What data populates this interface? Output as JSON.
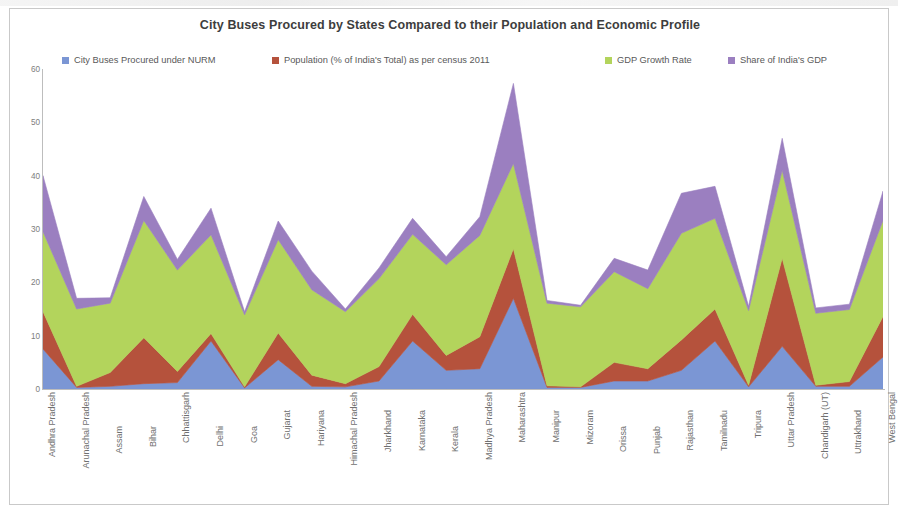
{
  "chart_data": {
    "type": "area",
    "stacked": true,
    "title": "City Buses Procured by States Compared to their Population and Economic Profile",
    "xlabel": "",
    "ylabel": "",
    "ylim": [
      0,
      60
    ],
    "yticks": [
      0,
      10,
      20,
      30,
      40,
      50,
      60
    ],
    "grid": false,
    "legend_position": "top",
    "categories": [
      "Andhra Pradesh",
      "Arunachal Pradesh",
      "Assam",
      "Bihar",
      "Chhattisgarh",
      "Delhi",
      "Goa",
      "Gujarat",
      "Hariyana",
      "Himachal Pradesh",
      "Jharkhand",
      "Karnataka",
      "Kerala",
      "Madhya Pradesh",
      "Maharashtra",
      "Manipur",
      "Mizoram",
      "Orissa",
      "Punjab",
      "Rajasthan",
      "Tamilnadu",
      "Tripura",
      "Uttar Pradesh",
      "Chandigarh (UT)",
      "Uttrakhand",
      "West Bengal"
    ],
    "series": [
      {
        "name": "City Buses Procured under NURM",
        "color": "#7b96d4",
        "values": [
          7.5,
          0.3,
          0.5,
          1.0,
          1.2,
          9.0,
          0.2,
          5.5,
          0.5,
          0.4,
          1.5,
          9.0,
          3.5,
          3.8,
          17.0,
          0.3,
          0.3,
          1.5,
          1.5,
          3.5,
          9.0,
          0.4,
          8.0,
          0.5,
          0.5,
          6.0
        ]
      },
      {
        "name": "Population (% of India's Total) as per census 2011",
        "color": "#b5523c",
        "values": [
          7.0,
          0.2,
          2.6,
          8.6,
          2.1,
          1.4,
          0.2,
          5.0,
          2.1,
          0.6,
          2.7,
          5.0,
          2.8,
          6.0,
          9.3,
          0.3,
          0.1,
          3.5,
          2.3,
          5.7,
          6.0,
          0.3,
          16.5,
          0.2,
          0.9,
          7.6
        ]
      },
      {
        "name": "GDP Growth Rate",
        "color": "#b3d45c",
        "values": [
          15.0,
          14.5,
          13.0,
          22.0,
          19.0,
          18.5,
          13.5,
          17.5,
          16.0,
          13.5,
          16.5,
          15.0,
          17.0,
          19.0,
          16.0,
          15.5,
          15.0,
          17.0,
          15.0,
          20.0,
          17.0,
          14.0,
          16.5,
          13.5,
          13.5,
          18.0
        ]
      },
      {
        "name": "Share of India's GDP",
        "color": "#9b7fc0",
        "values": [
          10.5,
          2.0,
          1.0,
          4.5,
          2.0,
          5.0,
          0.6,
          3.5,
          3.5,
          0.5,
          2.0,
          3.0,
          1.5,
          3.5,
          15.0,
          0.5,
          0.3,
          2.5,
          3.5,
          7.5,
          6.0,
          0.8,
          6.0,
          1.0,
          1.0,
          5.5
        ]
      }
    ]
  },
  "legend": {
    "items": [
      {
        "label": "City Buses Procured under NURM",
        "color": "#7b96d4",
        "left": 52,
        "swatch": "legend-swatch-buses"
      },
      {
        "label": "Population (% of India's Total) as per census 2011",
        "color": "#b5523c",
        "left": 262,
        "swatch": "legend-swatch-population"
      },
      {
        "label": "GDP Growth Rate",
        "color": "#b3d45c",
        "left": 595,
        "swatch": "legend-swatch-gdp-growth"
      },
      {
        "label": "Share of India's GDP",
        "color": "#9b7fc0",
        "left": 718,
        "swatch": "legend-swatch-gdp-share"
      }
    ]
  },
  "axes": {
    "y_ticks": [
      "60",
      "50",
      "40",
      "30",
      "20",
      "10",
      "0"
    ]
  }
}
